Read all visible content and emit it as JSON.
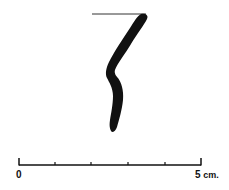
{
  "figure": {
    "type": "pottery-profile-drawing",
    "ink_color": "#111111",
    "background_color": "#ffffff"
  },
  "profile": {
    "rim_line": {
      "x1": 92,
      "y1": 14,
      "x2": 146,
      "y2": 14
    },
    "fill": "#111111"
  },
  "scale_bar": {
    "start_label": "0",
    "end_value": "5",
    "end_unit": "cm.",
    "units": 5,
    "x_start": 19,
    "x_end": 201,
    "y": 165,
    "tick_positions": [
      19,
      55,
      91,
      128,
      165,
      201
    ]
  }
}
